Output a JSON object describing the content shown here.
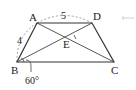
{
  "figure": {
    "type": "trapezoid",
    "vertices": {
      "A": {
        "label": "A",
        "x": 37,
        "y": 23
      },
      "D": {
        "label": "D",
        "x": 92,
        "y": 23
      },
      "B": {
        "label": "B",
        "x": 17,
        "y": 62
      },
      "C": {
        "label": "C",
        "x": 114,
        "y": 62
      },
      "E": {
        "label": "E",
        "x": 70,
        "y": 37
      }
    },
    "measures": {
      "AD": "5",
      "AB": "4",
      "angle_B": "60°"
    },
    "colors": {
      "line": "#333333",
      "dashed": "#777777",
      "background": "#ffffff"
    }
  }
}
